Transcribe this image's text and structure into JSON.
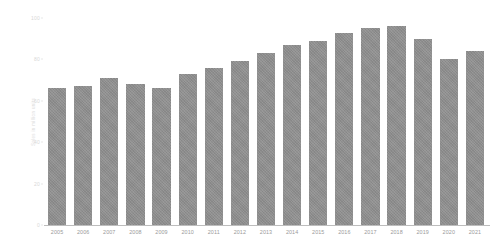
{
  "chart_data": {
    "type": "bar",
    "title": "",
    "subtitle": "",
    "xlabel": "",
    "ylabel": "Sales in million units",
    "categories": [
      "2005",
      "2006",
      "2007",
      "2008",
      "2009",
      "2010",
      "2011",
      "2012",
      "2013",
      "2014",
      "2015",
      "2016",
      "2017",
      "2018",
      "2019",
      "2020",
      "2021"
    ],
    "values": [
      66,
      67,
      71,
      68,
      66,
      73,
      76,
      79,
      83,
      87,
      89,
      93,
      95,
      96,
      90,
      80,
      84
    ],
    "series": [
      {
        "name": "Sales",
        "values": [
          66,
          67,
          71,
          68,
          66,
          73,
          76,
          79,
          83,
          87,
          89,
          93,
          95,
          96,
          90,
          80,
          84
        ]
      }
    ],
    "ylim": [
      0,
      100
    ],
    "yticks": [
      0,
      20,
      40,
      60,
      80,
      100
    ],
    "ytick_labels": [
      "0",
      "20",
      "40",
      "60",
      "80",
      "100"
    ],
    "grid": false,
    "legend": null,
    "legend_position": "none",
    "bar_color": "#8d8d8d",
    "axis_color": "#bdbdbd",
    "tick_label_color": "#9a9a9a",
    "ytick_label_color": "#d8d8d8",
    "background": "#ffffff"
  }
}
